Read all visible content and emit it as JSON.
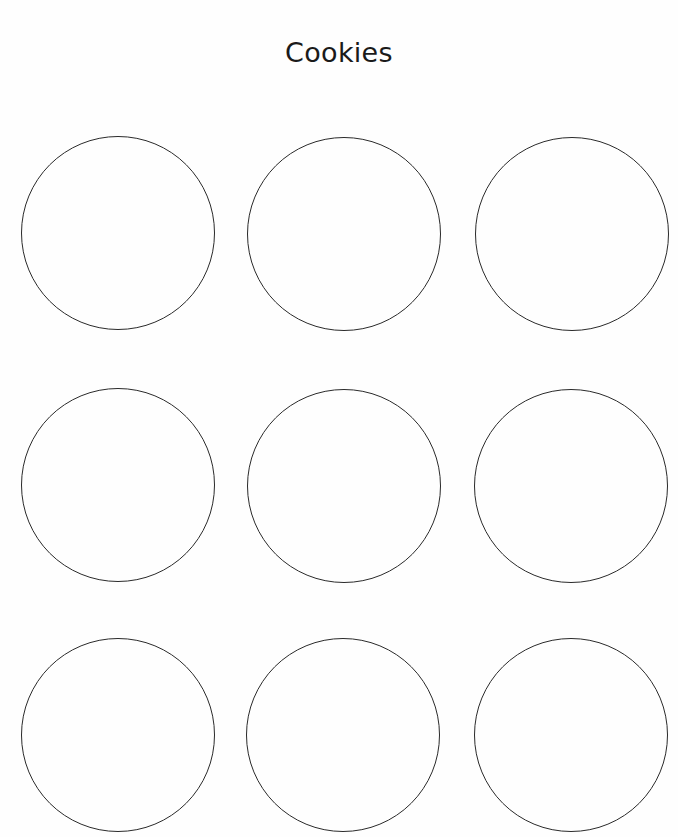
{
  "page": {
    "title": "Cookies"
  },
  "circles": [
    {
      "row": 1,
      "col": 1,
      "cx": 118,
      "cy": 233,
      "r": 96
    },
    {
      "row": 1,
      "col": 2,
      "cx": 344,
      "cy": 234,
      "r": 96
    },
    {
      "row": 1,
      "col": 3,
      "cx": 572,
      "cy": 234,
      "r": 96
    },
    {
      "row": 2,
      "col": 1,
      "cx": 118,
      "cy": 485,
      "r": 96
    },
    {
      "row": 2,
      "col": 2,
      "cx": 344,
      "cy": 486,
      "r": 96
    },
    {
      "row": 2,
      "col": 3,
      "cx": 571,
      "cy": 486,
      "r": 96
    },
    {
      "row": 3,
      "col": 1,
      "cx": 118,
      "cy": 735,
      "r": 96
    },
    {
      "row": 3,
      "col": 2,
      "cx": 343,
      "cy": 735,
      "r": 96
    },
    {
      "row": 3,
      "col": 3,
      "cx": 571,
      "cy": 735,
      "r": 96
    }
  ],
  "colors": {
    "outline": "#2a2a2a",
    "text": "#1a1a1a",
    "background": "#ffffff"
  }
}
